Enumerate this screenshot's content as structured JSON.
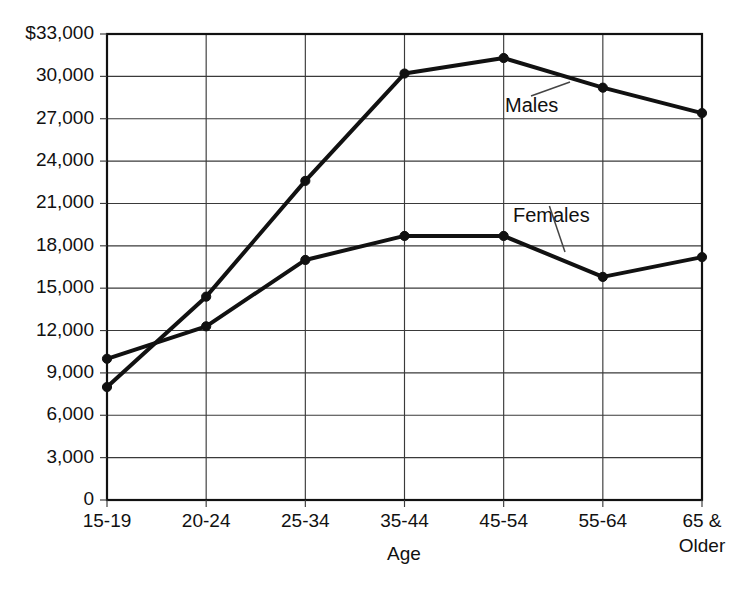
{
  "chart_data": {
    "type": "line",
    "title": "",
    "xlabel": "Age",
    "ylabel": "",
    "categories": [
      "15-19",
      "20-24",
      "25-34",
      "35-44",
      "45-54",
      "55-64",
      "65 & Older"
    ],
    "series": [
      {
        "name": "Males",
        "values": [
          8000,
          14400,
          22600,
          30200,
          31300,
          29200,
          27400
        ]
      },
      {
        "name": "Females",
        "values": [
          10000,
          12300,
          17000,
          18700,
          18700,
          15800,
          17200
        ]
      }
    ],
    "ylim": [
      0,
      33000
    ],
    "ytick_values": [
      0,
      3000,
      6000,
      9000,
      12000,
      15000,
      18000,
      21000,
      24000,
      27000,
      30000,
      33000
    ],
    "ytick_labels": [
      "0",
      "3,000",
      "6,000",
      "9,000",
      "12,000",
      "15,000",
      "18,000",
      "21,000",
      "24,000",
      "27,000",
      "30,000",
      "$33,000"
    ],
    "grid": true,
    "grid_horizontal": true,
    "grid_vertical": true,
    "legend_position": "inline-annotation",
    "line_color": "#111111",
    "grid_color": "#3a3a3a",
    "background_color": "#ffffff",
    "annotations": [
      {
        "text": "Males",
        "for_series": "Males",
        "x_px": 505,
        "y_px": 112,
        "leader_to_x": 570,
        "leader_to_y": 82
      },
      {
        "text": "Females",
        "for_series": "Females",
        "x_px": 513,
        "y_px": 222,
        "leader_to_x": 565,
        "leader_to_y": 252
      }
    ],
    "x_tick_extra_lines": {
      "65 & Older": [
        "65 &",
        "Older"
      ]
    }
  },
  "axis": {
    "x_label": "Age"
  }
}
